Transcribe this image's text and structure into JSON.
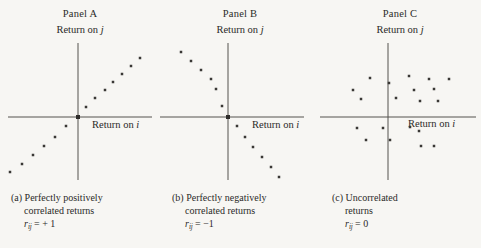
{
  "figure": {
    "background_color": "#f7f6f3",
    "ink_color": "#2b2a28",
    "axis_color": "#55524e",
    "point_color": "#3a3835"
  },
  "panels": [
    {
      "id": "panel-a",
      "title": "Panel A",
      "y_axis_label": "Return on j",
      "y_axis_label_var": "j",
      "x_axis_label": "Return on i",
      "x_axis_label_var": "i",
      "caption_marker": "(a)",
      "caption_line1": "Perfectly positively",
      "caption_line2": "correlated returns",
      "formula_symbol": "r",
      "formula_subscript": "ij",
      "formula_value": "= + 1"
    },
    {
      "id": "panel-b",
      "title": "Panel B",
      "y_axis_label": "Return on j",
      "y_axis_label_var": "j",
      "x_axis_label": "Return on i",
      "x_axis_label_var": "i",
      "caption_marker": "(b)",
      "caption_line1": "Perfectly negatively",
      "caption_line2": "correlated returns",
      "formula_symbol": "r",
      "formula_subscript": "ij",
      "formula_value": "= −1"
    },
    {
      "id": "panel-c",
      "title": "Panel C",
      "y_axis_label": "Return on j",
      "y_axis_label_var": "j",
      "x_axis_label": "Return on i",
      "x_axis_label_var": "i",
      "caption_marker": "(c)",
      "caption_line1": "Uncorrelated",
      "caption_line2": "returns",
      "formula_symbol": "r",
      "formula_subscript": "ij",
      "formula_value": "= 0"
    }
  ],
  "chart_data": [
    {
      "type": "scatter",
      "title": "Panel A",
      "subtitle": "(a) Perfectly positively correlated returns",
      "xlabel": "Return on i",
      "ylabel": "Return on j",
      "annotation": "r_ij = +1",
      "correlation": 1,
      "grid": false,
      "legend": "none",
      "axes_style": "crossed-origin",
      "origin_px": {
        "x": 78,
        "y": 117
      },
      "x_axis_px": {
        "x1": 8,
        "x2": 152,
        "y": 117
      },
      "y_axis_px": {
        "y1": 43,
        "y2": 180,
        "x": 78
      },
      "xlim": [
        -1,
        1
      ],
      "ylim": [
        -1,
        1
      ],
      "points": [
        {
          "x": -0.93,
          "y": -0.9
        },
        {
          "x": -0.75,
          "y": -0.77
        },
        {
          "x": -0.58,
          "y": -0.63
        },
        {
          "x": -0.42,
          "y": -0.48
        },
        {
          "x": -0.26,
          "y": -0.33
        },
        {
          "x": -0.1,
          "y": -0.16
        },
        {
          "x": 0.11,
          "y": 0.15
        },
        {
          "x": 0.24,
          "y": 0.29
        },
        {
          "x": 0.38,
          "y": 0.43
        },
        {
          "x": 0.5,
          "y": 0.56
        },
        {
          "x": 0.62,
          "y": 0.68
        },
        {
          "x": 0.75,
          "y": 0.81
        },
        {
          "x": 0.88,
          "y": 0.93
        }
      ],
      "points_px": [
        {
          "x": 10,
          "y": 172
        },
        {
          "x": 22,
          "y": 164
        },
        {
          "x": 33,
          "y": 155
        },
        {
          "x": 44,
          "y": 146
        },
        {
          "x": 55,
          "y": 137
        },
        {
          "x": 66,
          "y": 126
        },
        {
          "x": 86,
          "y": 107
        },
        {
          "x": 95,
          "y": 98
        },
        {
          "x": 105,
          "y": 90
        },
        {
          "x": 113,
          "y": 82
        },
        {
          "x": 122,
          "y": 74
        },
        {
          "x": 131,
          "y": 66
        },
        {
          "x": 140,
          "y": 58
        }
      ]
    },
    {
      "type": "scatter",
      "title": "Panel B",
      "subtitle": "(b) Perfectly negatively correlated returns",
      "xlabel": "Return on i",
      "ylabel": "Return on j",
      "annotation": "r_ij = -1",
      "correlation": -1,
      "grid": false,
      "legend": "none",
      "axes_style": "crossed-origin",
      "origin_px": {
        "x": 68,
        "y": 117
      },
      "x_axis_px": {
        "x1": 0,
        "x2": 144,
        "y": 117
      },
      "y_axis_px": {
        "y1": 43,
        "y2": 180,
        "x": 68
      },
      "xlim": [
        -1,
        1
      ],
      "ylim": [
        -1,
        1
      ],
      "points": [
        {
          "x": -0.92,
          "y": 0.92
        },
        {
          "x": -0.78,
          "y": 0.79
        },
        {
          "x": -0.64,
          "y": 0.66
        },
        {
          "x": -0.5,
          "y": 0.53
        },
        {
          "x": -0.34,
          "y": 0.38
        },
        {
          "x": -0.16,
          "y": 0.17
        },
        {
          "x": 0.13,
          "y": -0.13
        },
        {
          "x": 0.27,
          "y": -0.29
        },
        {
          "x": 0.4,
          "y": -0.44
        },
        {
          "x": 0.55,
          "y": -0.6
        },
        {
          "x": 0.7,
          "y": -0.75
        },
        {
          "x": 0.84,
          "y": -0.9
        }
      ],
      "points_px": [
        {
          "x": 21,
          "y": 52
        },
        {
          "x": 31,
          "y": 61
        },
        {
          "x": 41,
          "y": 70
        },
        {
          "x": 51,
          "y": 79
        },
        {
          "x": 56,
          "y": 89
        },
        {
          "x": 62,
          "y": 106
        },
        {
          "x": 77,
          "y": 126
        },
        {
          "x": 85,
          "y": 137
        },
        {
          "x": 93,
          "y": 147
        },
        {
          "x": 102,
          "y": 157
        },
        {
          "x": 111,
          "y": 167
        },
        {
          "x": 119,
          "y": 177
        }
      ]
    },
    {
      "type": "scatter",
      "title": "Panel C",
      "subtitle": "(c) Uncorrelated returns",
      "xlabel": "Return on i",
      "ylabel": "Return on j",
      "annotation": "r_ij = 0",
      "correlation": 0,
      "grid": false,
      "legend": "none",
      "axes_style": "crossed-origin",
      "origin_px": {
        "x": 68,
        "y": 117
      },
      "x_axis_px": {
        "x1": 0,
        "x2": 156,
        "y": 117
      },
      "y_axis_px": {
        "y1": 43,
        "y2": 180,
        "x": 68
      },
      "xlim": [
        -1,
        1
      ],
      "ylim": [
        -1,
        1
      ],
      "points": [
        {
          "x": -0.52,
          "y": 0.57
        },
        {
          "x": -0.77,
          "y": 0.4
        },
        {
          "x": -0.24,
          "y": 0.49
        },
        {
          "x": -0.65,
          "y": 0.26
        },
        {
          "x": -0.12,
          "y": 0.28
        },
        {
          "x": 0.07,
          "y": 0.6
        },
        {
          "x": 0.36,
          "y": 0.55
        },
        {
          "x": 0.66,
          "y": 0.55
        },
        {
          "x": 0.15,
          "y": 0.35
        },
        {
          "x": 0.44,
          "y": 0.37
        },
        {
          "x": 0.24,
          "y": 0.2
        },
        {
          "x": 0.5,
          "y": 0.2
        },
        {
          "x": -0.7,
          "y": -0.16
        },
        {
          "x": -0.32,
          "y": -0.16
        },
        {
          "x": -0.56,
          "y": -0.33
        },
        {
          "x": -0.21,
          "y": -0.33
        },
        {
          "x": 0.09,
          "y": -0.14
        },
        {
          "x": 0.21,
          "y": -0.2
        },
        {
          "x": 0.25,
          "y": -0.43
        },
        {
          "x": 0.43,
          "y": -0.43
        }
      ],
      "points_px": [
        {
          "x": 50,
          "y": 78
        },
        {
          "x": 33,
          "y": 90
        },
        {
          "x": 69,
          "y": 83
        },
        {
          "x": 41,
          "y": 99
        },
        {
          "x": 76,
          "y": 98
        },
        {
          "x": 89,
          "y": 76
        },
        {
          "x": 109,
          "y": 79
        },
        {
          "x": 129,
          "y": 79
        },
        {
          "x": 94,
          "y": 90
        },
        {
          "x": 114,
          "y": 89
        },
        {
          "x": 100,
          "y": 101
        },
        {
          "x": 118,
          "y": 101
        },
        {
          "x": 37,
          "y": 128
        },
        {
          "x": 63,
          "y": 128
        },
        {
          "x": 46,
          "y": 140
        },
        {
          "x": 70,
          "y": 140
        },
        {
          "x": 90,
          "y": 127
        },
        {
          "x": 99,
          "y": 131
        },
        {
          "x": 101,
          "y": 146
        },
        {
          "x": 114,
          "y": 146
        }
      ]
    }
  ]
}
